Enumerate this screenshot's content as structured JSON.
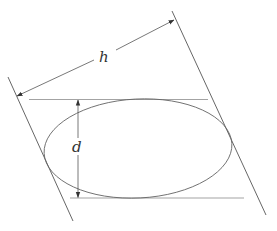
{
  "diagram": {
    "labels": {
      "slant_distance": "h",
      "vertical_distance": "d"
    },
    "colors": {
      "line": "#555555",
      "ellipse": "#666666",
      "tangent": "#999999",
      "text": "#333333"
    }
  }
}
